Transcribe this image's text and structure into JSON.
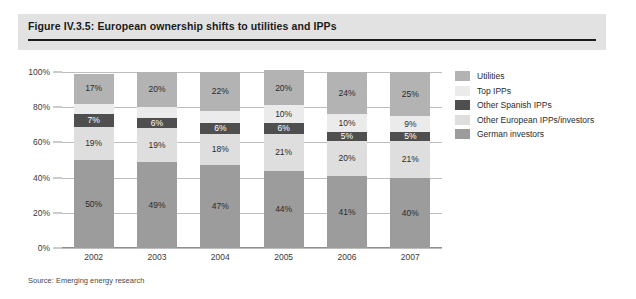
{
  "figure": {
    "title": "Figure IV.3.5: European ownership shifts to utilities and IPPs",
    "source": "Source: Emerging energy research"
  },
  "legend": {
    "position": "right",
    "items": [
      {
        "label": "Utilities",
        "color": "#b3b3b3"
      },
      {
        "label": "Top IPPs",
        "color": "#ebebeb"
      },
      {
        "label": "Other Spanish IPPs",
        "color": "#4f4f4f"
      },
      {
        "label": "Other European IPPs/investors",
        "color": "#dedede"
      },
      {
        "label": "German investors",
        "color": "#9c9c9c"
      }
    ]
  },
  "axes": {
    "y_ticks": [
      "100%",
      "80%",
      "60%",
      "40%",
      "20%",
      "0%"
    ],
    "x_ticks": [
      "2002",
      "2003",
      "2004",
      "2005",
      "2006",
      "2007"
    ]
  },
  "chart_data": {
    "type": "bar",
    "stacked": true,
    "stack_total": 100,
    "title": "Figure IV.3.5: European ownership shifts to utilities and IPPs",
    "xlabel": "",
    "ylabel": "",
    "ylim": [
      0,
      100
    ],
    "ytick_labels": [
      "0%",
      "20%",
      "40%",
      "60%",
      "80%",
      "100%"
    ],
    "grid": true,
    "legend_position": "right",
    "categories": [
      "2002",
      "2003",
      "2004",
      "2005",
      "2006",
      "2007"
    ],
    "series": [
      {
        "name": "German investors",
        "color": "#9c9c9c",
        "values": [
          50,
          49,
          47,
          44,
          41,
          40
        ],
        "labels": [
          "50%",
          "49%",
          "47%",
          "44%",
          "41%",
          "40%"
        ],
        "label_color": "dark"
      },
      {
        "name": "Other European IPPs/investors",
        "color": "#dedede",
        "values": [
          19,
          19,
          18,
          21,
          20,
          21
        ],
        "labels": [
          "19%",
          "19%",
          "18%",
          "21%",
          "20%",
          "21%"
        ],
        "label_color": "dark"
      },
      {
        "name": "Other Spanish IPPs",
        "color": "#4f4f4f",
        "values": [
          7,
          6,
          6,
          6,
          5,
          5
        ],
        "labels": [
          "7%",
          "6%",
          "6%",
          "6%",
          "5%",
          "5%"
        ],
        "label_color": "light"
      },
      {
        "name": "Top IPPs",
        "color": "#ebebeb",
        "values": [
          6,
          6,
          7,
          10,
          10,
          9
        ],
        "labels": [
          "6%",
          "6%",
          "7%",
          "10%",
          "10%",
          "9%"
        ],
        "label_color": "dark"
      },
      {
        "name": "Utilities",
        "color": "#b3b3b3",
        "values": [
          17,
          20,
          22,
          20,
          24,
          25
        ],
        "labels": [
          "17%",
          "20%",
          "22%",
          "20%",
          "24%",
          "25%"
        ],
        "label_color": "dark"
      }
    ]
  }
}
